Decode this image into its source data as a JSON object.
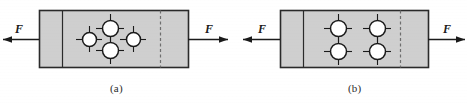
{
  "figure": {
    "background_color": "#ffffff",
    "plate_fill": "#cfcfcf",
    "plate_stroke": "#2a2a2a",
    "line_color": "#1a1a1a",
    "dashed_color": "#6e6e6e",
    "panels": [
      {
        "id": "panel-a",
        "caption": "(a)",
        "caption_x": 110,
        "caption_y": 82,
        "plate": {
          "x": 39,
          "y": 10,
          "width": 149,
          "height": 57
        },
        "inner_edge_x": 62,
        "dashed_line_x": 160,
        "force_left": {
          "label": "F",
          "label_x": 15,
          "label_y": 22,
          "arrow_from_x": 39,
          "arrow_to_x": 3,
          "arrow_y": 39,
          "direction": "left"
        },
        "force_right": {
          "label": "F",
          "label_x": 205,
          "label_y": 22,
          "arrow_from_x": 188,
          "arrow_to_x": 228,
          "arrow_y": 39,
          "direction": "right"
        },
        "rivet_pattern": "diamond",
        "rivet_count": 4,
        "rivets": [
          {
            "cx": 89,
            "cy": 39,
            "r": 7
          },
          {
            "cx": 110,
            "cy": 28,
            "r": 8
          },
          {
            "cx": 110,
            "cy": 50,
            "r": 8
          },
          {
            "cx": 133,
            "cy": 39,
            "r": 7
          }
        ]
      },
      {
        "id": "panel-b",
        "caption": "(b)",
        "caption_x": 348,
        "caption_y": 82,
        "plate": {
          "x": 280,
          "y": 10,
          "width": 148,
          "height": 57
        },
        "inner_edge_x": 303,
        "dashed_line_x": 400,
        "force_left": {
          "label": "F",
          "label_x": 258,
          "label_y": 22,
          "arrow_from_x": 280,
          "arrow_to_x": 243,
          "arrow_y": 39,
          "direction": "left"
        },
        "force_right": {
          "label": "F",
          "label_x": 443,
          "label_y": 22,
          "arrow_from_x": 428,
          "arrow_to_x": 465,
          "arrow_y": 39,
          "direction": "right"
        },
        "rivet_pattern": "grid-2x2",
        "rivet_count": 4,
        "rivets": [
          {
            "cx": 338,
            "cy": 28,
            "r": 8
          },
          {
            "cx": 377,
            "cy": 28,
            "r": 8
          },
          {
            "cx": 338,
            "cy": 51,
            "r": 8
          },
          {
            "cx": 377,
            "cy": 51,
            "r": 8
          }
        ]
      }
    ]
  }
}
